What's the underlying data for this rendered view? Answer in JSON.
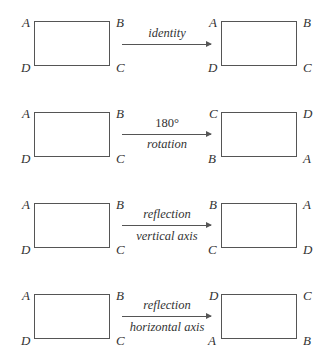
{
  "rows": [
    {
      "transformation": [
        "identity"
      ],
      "caption_italic": [
        true
      ],
      "source": {
        "top_left": "A",
        "top_right": "B",
        "bottom_left": "D",
        "bottom_right": "C"
      },
      "target": {
        "top_left": "A",
        "top_right": "B",
        "bottom_left": "D",
        "bottom_right": "C"
      }
    },
    {
      "transformation": [
        "180°",
        "rotation"
      ],
      "caption_italic": [
        false,
        true
      ],
      "source": {
        "top_left": "A",
        "top_right": "B",
        "bottom_left": "D",
        "bottom_right": "C"
      },
      "target": {
        "top_left": "C",
        "top_right": "D",
        "bottom_left": "B",
        "bottom_right": "A"
      }
    },
    {
      "transformation": [
        "reflection",
        "vertical axis"
      ],
      "caption_italic": [
        true,
        true
      ],
      "source": {
        "top_left": "A",
        "top_right": "B",
        "bottom_left": "D",
        "bottom_right": "C"
      },
      "target": {
        "top_left": "B",
        "top_right": "A",
        "bottom_left": "C",
        "bottom_right": "D"
      }
    },
    {
      "transformation": [
        "reflection",
        "horizontal axis"
      ],
      "caption_italic": [
        true,
        true
      ],
      "source": {
        "top_left": "A",
        "top_right": "B",
        "bottom_left": "D",
        "bottom_right": "C"
      },
      "target": {
        "top_left": "D",
        "top_right": "C",
        "bottom_left": "A",
        "bottom_right": "B"
      }
    }
  ]
}
